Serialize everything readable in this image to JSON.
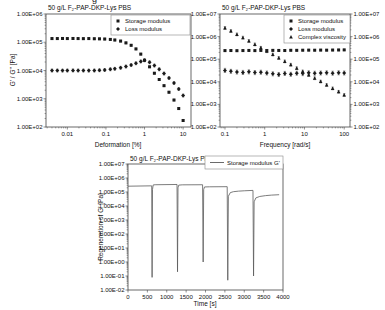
{
  "artifact": {
    "cropped_text": "g"
  },
  "colors": {
    "background": "#ffffff",
    "marker": "#1a1a1a",
    "line": "#5a5a5a",
    "frame": "#444444",
    "tick": "#444444",
    "text": "#111111",
    "error_bar": "#3a3a3a",
    "legend_border": "#888888"
  },
  "chart_data": [
    {
      "id": "chart-amplitude-sweep",
      "type": "scatter",
      "title": "50 g/L F₂-PAP-DKP-Lys PBS",
      "xlabel": "Deformation [%]",
      "ylabel": "G' / G'' [Pa]",
      "x_scale": "log",
      "y_scale": "log",
      "x_range": [
        0.0028,
        16
      ],
      "y_range": [
        100,
        1000000
      ],
      "grid": false,
      "legend_position": "top-right",
      "x_ticks": [
        {
          "v": 0.01,
          "label": "0.01"
        },
        {
          "v": 0.1,
          "label": "0.1"
        },
        {
          "v": 1,
          "label": "1"
        },
        {
          "v": 10,
          "label": "10"
        }
      ],
      "y_ticks": [
        {
          "v": 1000000,
          "label": "1.00E+06"
        },
        {
          "v": 100000,
          "label": "1.00E+05"
        },
        {
          "v": 10000,
          "label": "1.00E+04"
        },
        {
          "v": 1000,
          "label": "1.00E+03"
        },
        {
          "v": 100,
          "label": "1.00E+02"
        }
      ],
      "series": [
        {
          "name": "Storage modulus",
          "marker": "square",
          "err": 0.03,
          "points": [
            [
              0.004,
              135000
            ],
            [
              0.0055,
              135000
            ],
            [
              0.0075,
              136000
            ],
            [
              0.01,
              135000
            ],
            [
              0.014,
              136000
            ],
            [
              0.019,
              135000
            ],
            [
              0.026,
              134000
            ],
            [
              0.036,
              135000
            ],
            [
              0.05,
              133000
            ],
            [
              0.068,
              132000
            ],
            [
              0.093,
              130000
            ],
            [
              0.13,
              126000
            ],
            [
              0.17,
              120000
            ],
            [
              0.24,
              110000
            ],
            [
              0.33,
              95000
            ],
            [
              0.45,
              78000
            ],
            [
              0.6,
              58000
            ],
            [
              0.8,
              38000
            ],
            [
              1.0,
              23000
            ],
            [
              1.35,
              13500
            ],
            [
              1.8,
              8000
            ],
            [
              2.4,
              4800
            ],
            [
              3.2,
              2900
            ],
            [
              4.3,
              1700
            ],
            [
              5.8,
              900
            ],
            [
              7.7,
              450
            ],
            [
              10,
              170
            ]
          ]
        },
        {
          "name": "Loss modulus",
          "marker": "diamond",
          "err": 0.05,
          "points": [
            [
              0.004,
              10000
            ],
            [
              0.0055,
              10000
            ],
            [
              0.0075,
              9900
            ],
            [
              0.01,
              10000
            ],
            [
              0.014,
              10100
            ],
            [
              0.019,
              10000
            ],
            [
              0.026,
              10000
            ],
            [
              0.036,
              9900
            ],
            [
              0.05,
              10000
            ],
            [
              0.068,
              10200
            ],
            [
              0.093,
              10500
            ],
            [
              0.13,
              11000
            ],
            [
              0.17,
              11500
            ],
            [
              0.24,
              12500
            ],
            [
              0.33,
              13800
            ],
            [
              0.45,
              15500
            ],
            [
              0.6,
              18000
            ],
            [
              0.8,
              21000
            ],
            [
              1.0,
              23000
            ],
            [
              1.35,
              19500
            ],
            [
              1.8,
              15000
            ],
            [
              2.4,
              11000
            ],
            [
              3.2,
              7800
            ],
            [
              4.3,
              5400
            ],
            [
              5.8,
              3600
            ],
            [
              7.7,
              2200
            ],
            [
              10,
              1300
            ]
          ]
        }
      ]
    },
    {
      "id": "chart-frequency-sweep",
      "type": "scatter",
      "title": "50 g/L F₂-PAP-DKP-Lys PBS",
      "xlabel": "Frequency [rad/s]",
      "ylabel": "",
      "x_scale": "log",
      "y_scale": "log",
      "x_range": [
        0.075,
        140
      ],
      "y_range": [
        100,
        10000000
      ],
      "grid": false,
      "legend_position": "top-right",
      "y_ticks_right": true,
      "x_ticks": [
        {
          "v": 0.1,
          "label": "0.1"
        },
        {
          "v": 1,
          "label": "1"
        },
        {
          "v": 10,
          "label": "10"
        },
        {
          "v": 100,
          "label": "100"
        }
      ],
      "y_ticks": [
        {
          "v": 10000000,
          "label": "1.00E+07"
        },
        {
          "v": 1000000,
          "label": "1.00E+06"
        },
        {
          "v": 100000,
          "label": "1.00E+05"
        },
        {
          "v": 10000,
          "label": "1.00E+04"
        },
        {
          "v": 1000,
          "label": "1.00E+03"
        },
        {
          "v": 100,
          "label": "1.00E+02"
        }
      ],
      "series": [
        {
          "name": "Storage modulus",
          "marker": "square",
          "err": 0.03,
          "points": [
            [
              0.1,
              240000
            ],
            [
              0.141,
              242000
            ],
            [
              0.2,
              238000
            ],
            [
              0.283,
              241000
            ],
            [
              0.4,
              244000
            ],
            [
              0.566,
              240000
            ],
            [
              0.8,
              245000
            ],
            [
              1.13,
              243000
            ],
            [
              1.6,
              246000
            ],
            [
              2.26,
              244000
            ],
            [
              3.2,
              242000
            ],
            [
              4.53,
              248000
            ],
            [
              6.4,
              247000
            ],
            [
              9.05,
              250000
            ],
            [
              12.8,
              252000
            ],
            [
              18.1,
              250000
            ],
            [
              25.6,
              253000
            ],
            [
              36.2,
              251000
            ],
            [
              51.2,
              254000
            ],
            [
              72.4,
              256000
            ],
            [
              100,
              258000
            ]
          ]
        },
        {
          "name": "Loss modulus",
          "marker": "diamond",
          "err": 0.09,
          "points": [
            [
              0.1,
              32000
            ],
            [
              0.141,
              29000
            ],
            [
              0.2,
              27000
            ],
            [
              0.283,
              26000
            ],
            [
              0.4,
              27500
            ],
            [
              0.566,
              25500
            ],
            [
              0.8,
              26500
            ],
            [
              1.13,
              24500
            ],
            [
              1.6,
              22500
            ],
            [
              2.26,
              21000
            ],
            [
              3.2,
              23500
            ],
            [
              4.53,
              21500
            ],
            [
              6.4,
              24000
            ],
            [
              9.05,
              23000
            ],
            [
              12.8,
              25000
            ],
            [
              18.1,
              24000
            ],
            [
              25.6,
              24500
            ],
            [
              36.2,
              25000
            ],
            [
              51.2,
              24000
            ],
            [
              72.4,
              25000
            ],
            [
              100,
              24500
            ]
          ]
        },
        {
          "name": "Complex viscosity",
          "marker": "triangle",
          "err": 0.06,
          "points": [
            [
              0.1,
              2400000
            ],
            [
              0.141,
              1750000
            ],
            [
              0.2,
              1250000
            ],
            [
              0.283,
              900000
            ],
            [
              0.4,
              640000
            ],
            [
              0.566,
              450000
            ],
            [
              0.8,
              320000
            ],
            [
              1.13,
              225000
            ],
            [
              1.6,
              160000
            ],
            [
              2.26,
              113000
            ],
            [
              3.2,
              80000
            ],
            [
              4.53,
              57000
            ],
            [
              6.4,
              40000
            ],
            [
              9.05,
              28500
            ],
            [
              12.8,
              20000
            ],
            [
              18.1,
              14300
            ],
            [
              25.6,
              10200
            ],
            [
              36.2,
              7200
            ],
            [
              51.2,
              5100
            ],
            [
              72.4,
              3600
            ],
            [
              100,
              2600
            ]
          ]
        }
      ]
    },
    {
      "id": "chart-regeneration",
      "type": "line",
      "title": "50 g/L F₂-PAP-DKP-Lys PBS",
      "xlabel": "Time [s]",
      "ylabel": "Regeneration of G' [Pa]",
      "x_scale": "linear",
      "y_scale": "log",
      "x_range": [
        0,
        4000
      ],
      "y_range": [
        0.01,
        10000000
      ],
      "grid": false,
      "legend_position": "top-right",
      "x_ticks": [
        {
          "v": 0,
          "label": "0"
        },
        {
          "v": 500,
          "label": "500"
        },
        {
          "v": 1000,
          "label": "1000"
        },
        {
          "v": 1500,
          "label": "1500"
        },
        {
          "v": 2000,
          "label": "2000"
        },
        {
          "v": 2500,
          "label": "2500"
        },
        {
          "v": 3000,
          "label": "3000"
        },
        {
          "v": 3500,
          "label": "3500"
        },
        {
          "v": 4000,
          "label": "4000"
        }
      ],
      "y_ticks": [
        {
          "v": 10000000,
          "label": "1.00E+07"
        },
        {
          "v": 1000000,
          "label": "1.00E+06"
        },
        {
          "v": 100000,
          "label": "1.00E+05"
        },
        {
          "v": 10000,
          "label": "1.00E+04"
        },
        {
          "v": 1000,
          "label": "1.00E+03"
        },
        {
          "v": 100,
          "label": "1.00E+02"
        },
        {
          "v": 10,
          "label": "1.00E+01"
        },
        {
          "v": 1,
          "label": "1.00E+00"
        },
        {
          "v": 0.1,
          "label": "1.00E-01"
        },
        {
          "v": 0.01,
          "label": "1.00E-02"
        }
      ],
      "series": [
        {
          "name": "Storage modulus G'",
          "marker": "line",
          "points": [
            [
              0,
              260000
            ],
            [
              590,
              275000
            ],
            [
              612,
              275000
            ],
            [
              622,
              0.08
            ],
            [
              632,
              150000
            ],
            [
              650,
              320000
            ],
            [
              700,
              330000
            ],
            [
              1265,
              345000
            ],
            [
              1278,
              0.2
            ],
            [
              1290,
              200000
            ],
            [
              1310,
              310000
            ],
            [
              1400,
              325000
            ],
            [
              1925,
              330000
            ],
            [
              1940,
              1.0
            ],
            [
              1953,
              150000
            ],
            [
              1975,
              230000
            ],
            [
              2100,
              235000
            ],
            [
              2560,
              240000
            ],
            [
              2575,
              0.05
            ],
            [
              2590,
              50000
            ],
            [
              2640,
              90000
            ],
            [
              2720,
              105000
            ],
            [
              2850,
              115000
            ],
            [
              3000,
              122000
            ],
            [
              3225,
              130000
            ],
            [
              3240,
              0.1
            ],
            [
              3255,
              20000
            ],
            [
              3300,
              38000
            ],
            [
              3400,
              48000
            ],
            [
              3550,
              55000
            ],
            [
              3700,
              60000
            ],
            [
              3900,
              64000
            ]
          ]
        }
      ]
    }
  ]
}
